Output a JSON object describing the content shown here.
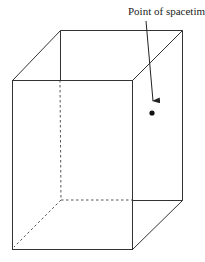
{
  "diagram": {
    "type": "3d-box-spacetime",
    "annotation": {
      "label": "Point of spacetime",
      "arrow_from": [
        146,
        21
      ],
      "arrow_to": [
        153,
        101
      ]
    },
    "point": {
      "x": 152,
      "y": 113,
      "r": 2.6
    },
    "vertices": {
      "front_top_left": [
        12,
        80
      ],
      "front_top_right": [
        132,
        80
      ],
      "front_bottom_left": [
        13,
        249
      ],
      "front_bottom_right": [
        132,
        249
      ],
      "back_top_left": [
        60,
        30
      ],
      "back_top_right": [
        182,
        30
      ],
      "back_bottom_left": [
        61,
        200
      ],
      "back_bottom_right": [
        182,
        200
      ]
    },
    "colors": {
      "line": "#333333",
      "dashed": "#555555",
      "point": "#111111",
      "background": "#ffffff"
    }
  }
}
